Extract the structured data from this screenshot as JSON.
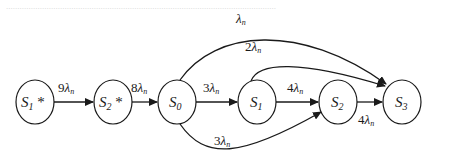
{
  "diagram": {
    "type": "state-transition",
    "nodes": [
      {
        "id": "S1star",
        "label": "S",
        "sub": "1",
        "suffix": " *",
        "cx": 35,
        "cy": 102
      },
      {
        "id": "S2star",
        "label": "S",
        "sub": "2",
        "suffix": " *",
        "cx": 113,
        "cy": 102
      },
      {
        "id": "S0",
        "label": "S",
        "sub": "0",
        "suffix": "",
        "cx": 177,
        "cy": 102
      },
      {
        "id": "S1",
        "label": "S",
        "sub": "1",
        "suffix": "",
        "cx": 257,
        "cy": 102
      },
      {
        "id": "S2",
        "label": "S",
        "sub": "2",
        "suffix": "",
        "cx": 338,
        "cy": 102
      },
      {
        "id": "S3",
        "label": "S",
        "sub": "3",
        "suffix": "",
        "cx": 402,
        "cy": 102
      }
    ],
    "edges": [
      {
        "from": "S1star",
        "to": "S2star",
        "coef": "9",
        "rate": "λ",
        "sub": "n"
      },
      {
        "from": "S2star",
        "to": "S0",
        "coef": "8",
        "rate": "λ",
        "sub": "n"
      },
      {
        "from": "S0",
        "to": "S1",
        "coef": "3",
        "rate": "λ",
        "sub": "n"
      },
      {
        "from": "S1",
        "to": "S2",
        "coef": "4",
        "rate": "λ",
        "sub": "n"
      },
      {
        "from": "S2",
        "to": "S3",
        "coef": "4",
        "rate": "λ",
        "sub": "n"
      },
      {
        "from": "S0",
        "to": "S3",
        "coef": "",
        "rate": "λ",
        "sub": "n"
      },
      {
        "from": "S1",
        "to": "S3",
        "coef": "2",
        "rate": "λ",
        "sub": "n"
      },
      {
        "from": "S0",
        "to": "S2",
        "coef": "3",
        "rate": "λ",
        "sub": "n"
      }
    ]
  },
  "bleed_text": "........................................................................................................................"
}
